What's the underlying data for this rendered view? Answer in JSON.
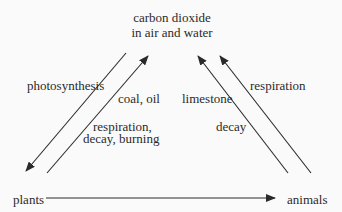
{
  "diagram": {
    "nodes": {
      "co2": {
        "line1": "carbon dioxide",
        "line2": "in air and water"
      },
      "plants": {
        "label": "plants"
      },
      "animals": {
        "label": "animals"
      }
    },
    "edges": [
      {
        "from": "co2",
        "to": "plants",
        "label": "photosynthesis"
      },
      {
        "from": "plants",
        "to": "co2",
        "label_top": "coal, oil",
        "label_line1": "respiration,",
        "label_line2": "decay, burning"
      },
      {
        "from": "animals",
        "to": "co2",
        "label_top": "limestone",
        "label_bottom": "decay"
      },
      {
        "from": "animals",
        "to": "co2",
        "label": "respiration"
      },
      {
        "from": "plants",
        "to": "animals",
        "label": ""
      }
    ],
    "colors": {
      "line": "#2a2a2a",
      "background": "#fafafa"
    }
  }
}
